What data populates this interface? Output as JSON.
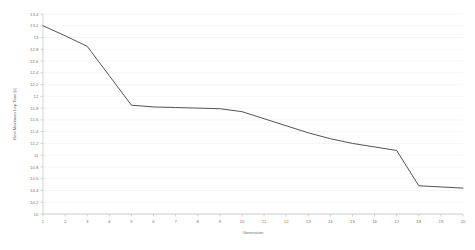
{
  "chart_data": {
    "type": "line",
    "title": "",
    "xlabel": "Generation",
    "ylabel": "Best Maximum Lap Time [s]",
    "x": [
      1,
      2,
      3,
      4,
      5,
      6,
      7,
      8,
      9,
      10,
      11,
      12,
      13,
      14,
      15,
      16,
      17,
      18,
      19,
      20
    ],
    "values": [
      13.2,
      13.03,
      12.85,
      12.35,
      11.85,
      11.82,
      11.81,
      11.8,
      11.79,
      11.74,
      11.62,
      11.5,
      11.38,
      11.28,
      11.2,
      11.14,
      11.08,
      10.48,
      10.46,
      10.44
    ],
    "series": [
      {
        "name": "Best Maximum Lap Time",
        "values": [
          13.2,
          13.03,
          12.85,
          12.35,
          11.85,
          11.82,
          11.81,
          11.8,
          11.79,
          11.74,
          11.62,
          11.5,
          11.38,
          11.28,
          11.2,
          11.14,
          11.08,
          10.48,
          10.46,
          10.44
        ]
      }
    ],
    "xlim": [
      1,
      20
    ],
    "ylim": [
      10,
      13.4
    ],
    "xticks": [
      "1",
      "2",
      "3",
      "4",
      "5",
      "6",
      "7",
      "8",
      "9",
      "10",
      "11",
      "12",
      "13",
      "14",
      "15",
      "16",
      "17",
      "18",
      "19",
      "20"
    ],
    "yticks": [
      "10",
      "10.2",
      "10.4",
      "10.6",
      "10.8",
      "11",
      "11.2",
      "11.4",
      "11.6",
      "11.8",
      "12",
      "12.2",
      "12.4",
      "12.6",
      "12.8",
      "13",
      "13.2",
      "13.4"
    ],
    "ytick_values": [
      10,
      10.2,
      10.4,
      10.6,
      10.8,
      11,
      11.2,
      11.4,
      11.6,
      11.8,
      12,
      12.2,
      12.4,
      12.6,
      12.8,
      13,
      13.2,
      13.4
    ],
    "grid": true,
    "grid_axis": "y",
    "legend": false,
    "legend_position": "none",
    "line_color": "#4a4a4a",
    "grid_color": "#eaeaea",
    "axis_color": "#b5b5b5",
    "background_color": "#ffffff"
  }
}
